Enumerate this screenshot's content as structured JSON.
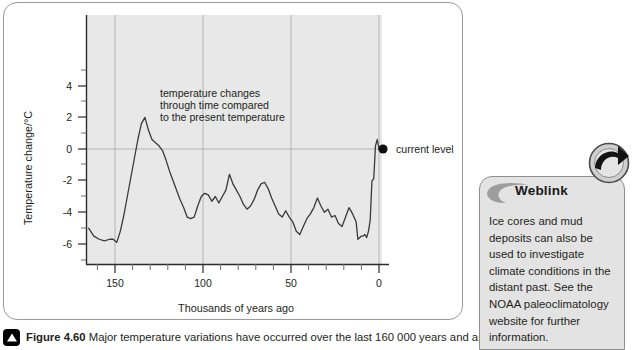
{
  "figure": {
    "caption_label": "Figure 4.60",
    "caption_text": "Major temperature variations have occurred over the last 160 000 years and are",
    "caption_icon": "triangle-bullet-icon"
  },
  "weblink": {
    "title": "Weblink",
    "arrow_icon": "circular-arrow-icon",
    "crescent_icon": "crescent-icon",
    "body": "Ice cores and mud deposits can also be used to investigate climate conditions in the distant past. See the NOAA paleoclimatology website for further information."
  },
  "chart_data": {
    "type": "line",
    "title": "",
    "xlabel": "Thousands of years ago",
    "ylabel": "Temperature change/°C",
    "xlim": [
      168,
      -4
    ],
    "ylim": [
      -7.2,
      5.4
    ],
    "x_ticks": [
      150,
      100,
      50,
      0
    ],
    "x_tick_labels": [
      "150",
      "100",
      "50",
      "0"
    ],
    "x_minor_step": 10,
    "y_ticks": [
      4,
      2,
      0,
      -2,
      -4,
      -6
    ],
    "y_tick_labels": [
      "4",
      "2",
      "0",
      "-2",
      "-4",
      "-6"
    ],
    "y_minor_step": 1,
    "grid": "vertical at x ticks, horizontal at y=0",
    "plot_background": "#e8e8e8",
    "line_color": "#3a3a3a",
    "annotations": [
      {
        "name": "series-annotation",
        "text": "temperature changes\nthrough time compared\nto the present temperature",
        "x": 122,
        "y": 3.0
      },
      {
        "name": "current-level-annotation",
        "text": "current level",
        "x": 0,
        "y": 0,
        "marker": "filled-circle"
      }
    ],
    "series": [
      {
        "name": "Temperature change",
        "x": [
          165,
          162,
          159,
          156,
          153,
          151,
          149,
          147,
          145,
          143,
          141,
          139,
          137,
          135,
          133,
          131,
          129,
          128,
          127,
          125,
          123,
          121,
          119,
          117,
          115,
          113,
          111,
          109,
          107,
          105,
          103,
          101,
          99,
          97,
          95,
          93,
          91,
          89,
          87,
          85,
          83,
          81,
          79,
          77,
          75,
          73,
          71,
          69,
          67,
          65,
          63,
          61,
          59,
          57,
          55,
          53,
          51,
          49,
          47,
          45,
          43,
          41,
          39,
          37,
          35,
          33,
          31,
          29,
          27,
          25,
          23,
          21,
          19,
          17,
          15,
          13,
          11,
          9,
          7,
          5,
          3,
          1,
          0
        ],
        "y": [
          -5.0,
          -5.5,
          -5.7,
          -5.8,
          -5.7,
          -5.7,
          -5.9,
          -5.2,
          -4.2,
          -3.0,
          -1.8,
          -0.6,
          0.6,
          1.6,
          2.0,
          1.2,
          0.6,
          0.5,
          0.4,
          0.2,
          -0.1,
          -0.7,
          -1.4,
          -2.0,
          -2.6,
          -3.2,
          -3.7,
          -4.3,
          -4.4,
          -4.3,
          -3.6,
          -3.0,
          -2.8,
          -2.9,
          -3.3,
          -3.0,
          -3.4,
          -3.0,
          -2.6,
          -1.6,
          -2.2,
          -2.6,
          -3.0,
          -3.5,
          -3.8,
          -3.6,
          -3.2,
          -2.6,
          -2.2,
          -2.1,
          -2.5,
          -3.1,
          -3.6,
          -4.1,
          -4.3,
          -3.9,
          -4.3,
          -4.6,
          -5.2,
          -5.4,
          -4.9,
          -4.4,
          -4.1,
          -3.7,
          -3.1,
          -3.6,
          -4.0,
          -3.8,
          -4.3,
          -4.2,
          -4.7,
          -4.9,
          -4.3,
          -3.7,
          -4.1,
          -4.6,
          -4.3,
          -5.2,
          -5.6,
          -5.5,
          -5.7,
          -5.9,
          -5.7
        ]
      }
    ],
    "tail": {
      "comment": "steep rise to current level at x=0",
      "x": [
        12,
        11,
        10,
        9,
        8,
        7,
        6,
        5,
        4,
        3,
        2,
        1,
        0
      ],
      "y": [
        -5.7,
        -5.6,
        -5.5,
        -5.5,
        -5.4,
        -5.6,
        -5.2,
        -4.5,
        -2.0,
        -1.9,
        0.2,
        0.6,
        0.0
      ]
    }
  }
}
